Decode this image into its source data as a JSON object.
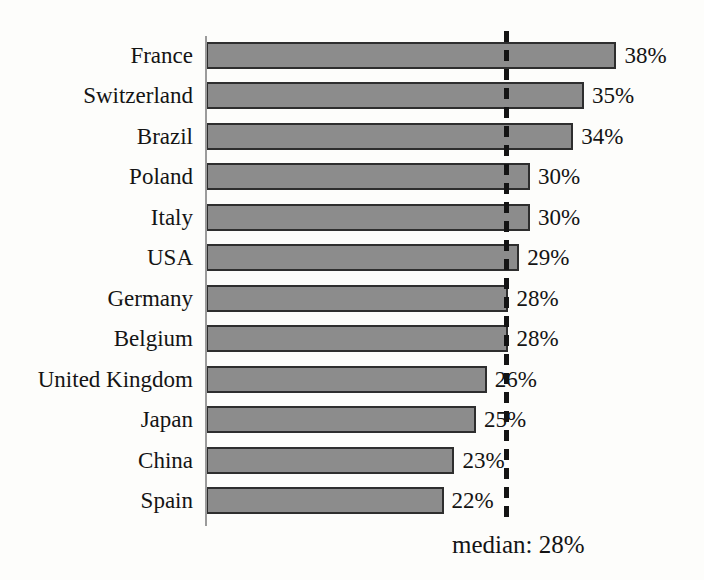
{
  "chart_data": {
    "type": "bar",
    "orientation": "horizontal",
    "title": "",
    "xlabel": "",
    "ylabel": "",
    "categories": [
      "France",
      "Switzerland",
      "Brazil",
      "Poland",
      "Italy",
      "USA",
      "Germany",
      "Belgium",
      "United Kingdom",
      "Japan",
      "China",
      "Spain"
    ],
    "values": [
      38,
      35,
      34,
      30,
      30,
      29,
      28,
      28,
      26,
      25,
      23,
      22
    ],
    "value_suffix": "%",
    "xlim": [
      0,
      42
    ],
    "grid": false,
    "legend": false,
    "median": 28,
    "median_label": "median: 28%"
  },
  "colors": {
    "bar_fill": "#8c8c8c",
    "bar_border": "#2e2e2e",
    "axis_line": "#9b9b9b",
    "median_line": "#141414",
    "text": "#141414",
    "background": "#fdfdfb"
  }
}
